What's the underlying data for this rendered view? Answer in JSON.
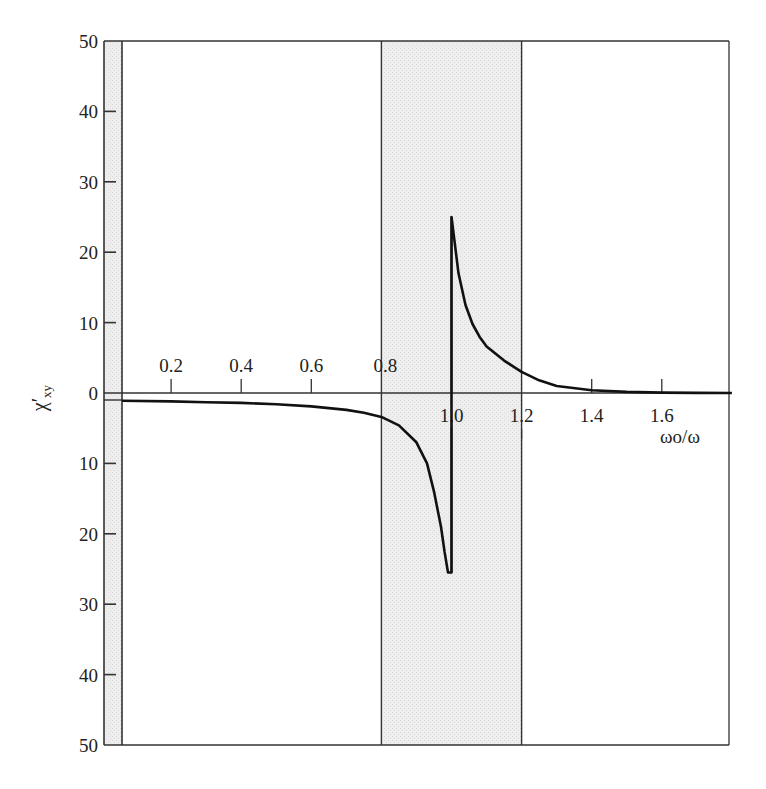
{
  "chart_data": {
    "type": "line",
    "title": "",
    "xlabel": "ω₀/ω",
    "ylabel": "χ′xy",
    "xlim": [
      0.0,
      1.8
    ],
    "ylim": [
      -50,
      50
    ],
    "grid": false,
    "legend": null,
    "x_ticks": [
      "0.2",
      "0.4",
      "0.6",
      "0.8",
      "1.0",
      "1.2",
      "1.4",
      "1.6"
    ],
    "y_ticks_upper": [
      "50",
      "40",
      "30",
      "20",
      "10",
      "0"
    ],
    "y_ticks_lower": [
      "10",
      "20",
      "30",
      "40",
      "50"
    ],
    "shaded_regions": [
      {
        "from": 0.8,
        "to": 1.2,
        "color": "#ececec",
        "description": "resonance band"
      },
      {
        "from": 0.0,
        "to": 0.06,
        "color": "#ececec",
        "description": "left axis band"
      }
    ],
    "series": [
      {
        "name": "χ′xy",
        "x": [
          0.06,
          0.2,
          0.3,
          0.4,
          0.5,
          0.6,
          0.7,
          0.75,
          0.8,
          0.85,
          0.9,
          0.93,
          0.95,
          0.97,
          0.98,
          0.99,
          1.0,
          1.0,
          1.01,
          1.02,
          1.04,
          1.06,
          1.08,
          1.1,
          1.15,
          1.2,
          1.25,
          1.3,
          1.4,
          1.5,
          1.6,
          1.7,
          1.8
        ],
        "y": [
          -1.1,
          -1.2,
          -1.3,
          -1.4,
          -1.6,
          -1.9,
          -2.4,
          -2.8,
          -3.4,
          -4.6,
          -7.0,
          -10.0,
          -14.0,
          -19.0,
          -22.5,
          -25.5,
          -25.5,
          25.0,
          21.0,
          17.0,
          12.5,
          9.8,
          8.0,
          6.6,
          4.6,
          3.0,
          1.8,
          1.0,
          0.4,
          0.15,
          0.05,
          0.02,
          0.0
        ]
      }
    ],
    "annotations": [
      {
        "text": "Vertical marker line at ω₀/ω = 1.0",
        "x": 1.0
      }
    ]
  }
}
